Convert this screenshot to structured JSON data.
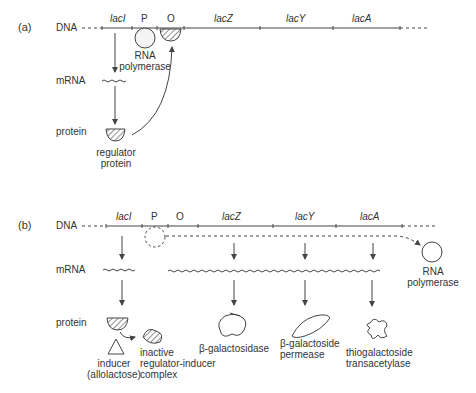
{
  "panel_a": {
    "label": "(a)",
    "rows": {
      "dna": "DNA",
      "mrna": "mRNA",
      "protein": "protein"
    },
    "genes": {
      "laci": "lacI",
      "p": "P",
      "o": "O",
      "lacz": "lacZ",
      "lacy": "lacY",
      "laca": "lacA"
    },
    "rna_polymerase": [
      "RNA",
      "polymerase"
    ],
    "regulator": [
      "regulator",
      "protein"
    ]
  },
  "panel_b": {
    "label": "(b)",
    "rows": {
      "dna": "DNA",
      "mrna": "mRNA",
      "protein": "protein"
    },
    "genes": {
      "laci": "lacI",
      "p": "P",
      "o": "O",
      "lacz": "lacZ",
      "lacy": "lacY",
      "laca": "lacA"
    },
    "rna_polymerase": [
      "RNA",
      "polymerase"
    ],
    "inducer": [
      "inducer",
      "(allolactose)"
    ],
    "complex": [
      "inactive",
      "regulator-inducer",
      "complex"
    ],
    "enzymes": {
      "galactosidase": [
        "β-galactosidase"
      ],
      "permease": [
        "β-galactoside",
        "permease"
      ],
      "transacetylase": [
        "thiogalactoside",
        "transacetylase"
      ]
    }
  },
  "colors": {
    "line": "#444444",
    "text": "#333333",
    "background": "#ffffff"
  }
}
